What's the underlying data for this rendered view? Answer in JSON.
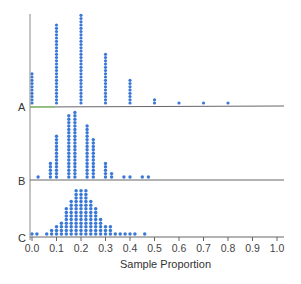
{
  "chart_data": {
    "type": "scatter",
    "subtype": "stacked dot plot",
    "title": "",
    "xlabel": "Sample Proportion",
    "ylabel": "",
    "xlim": [
      0.0,
      1.0
    ],
    "x_ticks": [
      "0.0",
      "0.1",
      "0.2",
      "0.3",
      "0.4",
      "0.5",
      "0.6",
      "0.7",
      "0.8",
      "0.9",
      "1.0"
    ],
    "grid": false,
    "dot_color": "#3a78d8",
    "panels": [
      {
        "name": "A",
        "x": [
          0.0,
          0.1,
          0.2,
          0.3,
          0.4,
          0.5,
          0.6,
          0.7,
          0.8
        ],
        "counts": [
          10,
          25,
          28,
          16,
          8,
          2,
          1,
          1,
          1
        ]
      },
      {
        "name": "B",
        "x": [
          0.025,
          0.075,
          0.1,
          0.15,
          0.175,
          0.225,
          0.25,
          0.3,
          0.325,
          0.375,
          0.4,
          0.45,
          0.475
        ],
        "counts": [
          1,
          5,
          13,
          19,
          20,
          16,
          12,
          5,
          2,
          1,
          1,
          1,
          1
        ]
      },
      {
        "name": "C",
        "x": [
          0.0,
          0.02,
          0.06,
          0.08,
          0.1,
          0.12,
          0.14,
          0.16,
          0.18,
          0.2,
          0.22,
          0.24,
          0.26,
          0.28,
          0.3,
          0.32,
          0.34,
          0.36,
          0.38,
          0.4,
          0.42,
          0.46
        ],
        "counts": [
          1,
          1,
          1,
          2,
          3,
          4,
          8,
          10,
          13,
          13,
          13,
          10,
          8,
          5,
          3,
          3,
          1,
          1,
          1,
          1,
          1,
          1
        ]
      }
    ]
  },
  "labels": {
    "panel_a": "A",
    "panel_b": "B",
    "panel_c": "C",
    "x_axis_title": "Sample Proportion"
  },
  "ticks": [
    "0.0",
    "0.1",
    "0.2",
    "0.3",
    "0.4",
    "0.5",
    "0.6",
    "0.7",
    "0.8",
    "0.9",
    "1.0"
  ]
}
